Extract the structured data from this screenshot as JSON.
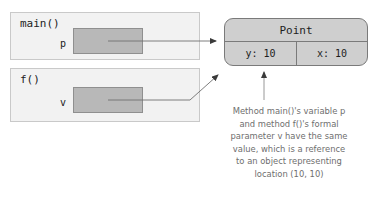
{
  "diagram": {
    "colors": {
      "frame_fill": "#f2f2f2",
      "frame_border": "#c9c9c9",
      "slot_fill": "#b8b8b8",
      "slot_border": "#8f8f8f",
      "object_fill": "#cfcfcf",
      "object_border": "#7a7a7a",
      "connector": "#6f6f6f",
      "caption_text": "#6e6e6e"
    },
    "frames": [
      {
        "name": "main-frame",
        "title": "main()",
        "variable": {
          "label": "p",
          "value": ""
        }
      },
      {
        "name": "f-frame",
        "title": "f()",
        "variable": {
          "label": "v",
          "value": ""
        }
      }
    ],
    "heap_object": {
      "type_name": "Point",
      "fields": [
        {
          "name": "y-field",
          "text": "y: 10"
        },
        {
          "name": "x-field",
          "text": "x: 10"
        }
      ]
    },
    "connectors": [
      {
        "name": "p-to-point-arrow",
        "from": "p",
        "to": "Point"
      },
      {
        "name": "v-to-point-arrow",
        "from": "v",
        "to": "Point"
      },
      {
        "name": "caption-to-point-arrow",
        "from": "caption",
        "to": "Point"
      }
    ],
    "caption": {
      "lines": [
        "Method main()'s variable p",
        "and method f()'s formal",
        "parameter v have the same",
        "value, which is a reference",
        "to an object representing",
        "location (10, 10)"
      ]
    }
  }
}
